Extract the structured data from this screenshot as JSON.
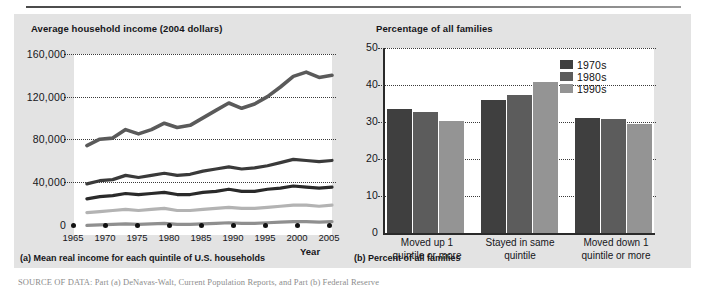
{
  "figure": {
    "background_color": "#e3e3e3",
    "source_note": "SOURCE OF DATA: Part (a) DeNavas-Walt, Current Population Reports, and Part (b) Federal Reserve"
  },
  "panel_a": {
    "title": "Average household income (2004 dollars)",
    "caption": "(a) Mean real income for each quintile of U.S. households",
    "xaxis_name": "Year"
  },
  "panel_b": {
    "title": "Percentage of all families",
    "caption": "(b) Percent of all families"
  },
  "legend": {
    "items": [
      {
        "label": "1970s",
        "color": "#3f3f3f"
      },
      {
        "label": "1980s",
        "color": "#5c5c5c"
      },
      {
        "label": "1990s",
        "color": "#949494"
      }
    ]
  },
  "chart_data": [
    {
      "type": "line",
      "panel": "a",
      "title": "Average household income (2004 dollars)",
      "subtitle": "(a) Mean real income for each quintile of U.S. households",
      "xlabel": "Year",
      "ylabel": "Average household income (2004 dollars)",
      "xlim": [
        1965,
        2005
      ],
      "ylim": [
        0,
        170000
      ],
      "xticks": [
        1965,
        1970,
        1975,
        1980,
        1985,
        1990,
        1995,
        2000,
        2005
      ],
      "yticks": [
        0,
        40000,
        80000,
        120000,
        160000
      ],
      "ytick_labels": [
        "0",
        "40,000",
        "80,000",
        "120,000",
        "160,000"
      ],
      "grid": "horizontal-dotted",
      "legend": "none",
      "x": [
        1967,
        1969,
        1971,
        1973,
        1975,
        1977,
        1979,
        1981,
        1983,
        1985,
        1987,
        1989,
        1991,
        1993,
        1995,
        1997,
        1999,
        2001,
        2003,
        2005
      ],
      "series": [
        {
          "name": "Highest quintile",
          "color": "#5a5a5a",
          "values": [
            84000,
            90000,
            91000,
            99000,
            95000,
            99000,
            105000,
            101000,
            103000,
            110000,
            117000,
            124000,
            119000,
            123000,
            130000,
            139000,
            149000,
            153000,
            148000,
            150000
          ]
        },
        {
          "name": "Fourth quintile",
          "color": "#3a3a3a",
          "values": [
            48000,
            51000,
            52000,
            56000,
            54000,
            56000,
            58000,
            56000,
            57000,
            60000,
            62000,
            64000,
            62000,
            63000,
            65000,
            68000,
            71000,
            70000,
            69000,
            70000
          ]
        },
        {
          "name": "Third quintile",
          "color": "#2a2a2a",
          "values": [
            34000,
            36000,
            37000,
            39000,
            38000,
            39000,
            40000,
            38000,
            38000,
            40000,
            41000,
            43000,
            41000,
            41000,
            43000,
            44000,
            46000,
            45000,
            44000,
            45000
          ]
        },
        {
          "name": "Second quintile",
          "color": "#b3b3b3",
          "values": [
            21000,
            22000,
            23000,
            24000,
            23000,
            24000,
            25000,
            23000,
            23000,
            24000,
            25000,
            26000,
            25000,
            25000,
            26000,
            27000,
            28000,
            28000,
            27000,
            28000
          ]
        },
        {
          "name": "Lowest quintile",
          "color": "#8f8f8f",
          "values": [
            9000,
            9500,
            10000,
            10500,
            10000,
            10500,
            11000,
            10000,
            10000,
            10500,
            11000,
            11500,
            11000,
            11000,
            11500,
            12000,
            12500,
            12500,
            12000,
            12500
          ]
        }
      ]
    },
    {
      "type": "bar",
      "panel": "b",
      "title": "Percentage of all families",
      "subtitle": "(b) Percent of all families",
      "xlabel": "",
      "ylabel": "Percentage of all families",
      "ylim": [
        0,
        50
      ],
      "yticks": [
        0,
        10,
        20,
        30,
        40,
        50
      ],
      "grid": "horizontal-dotted",
      "legend_position": "top-right",
      "categories": [
        "Moved up 1 quintile or more",
        "Stayed in same quintile",
        "Moved down 1 quintile or more"
      ],
      "category_lines": [
        [
          "Moved up 1",
          "quintile or more"
        ],
        [
          "Stayed in same",
          "quintile"
        ],
        [
          "Moved down 1",
          "quintile or more"
        ]
      ],
      "series": [
        {
          "name": "1970s",
          "color": "#3f3f3f",
          "values": [
            33.5,
            36.0,
            31.0
          ]
        },
        {
          "name": "1980s",
          "color": "#5c5c5c",
          "values": [
            32.8,
            37.4,
            30.8
          ]
        },
        {
          "name": "1990s",
          "color": "#949494",
          "values": [
            30.3,
            40.7,
            29.5
          ]
        }
      ]
    }
  ]
}
